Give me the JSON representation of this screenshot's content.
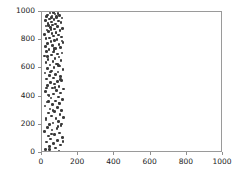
{
  "chart_data": {
    "type": "scatter",
    "title": "",
    "xlabel": "",
    "ylabel": "",
    "xlim": [
      0,
      1000
    ],
    "ylim": [
      0,
      1000
    ],
    "xticks": [
      0,
      200,
      400,
      600,
      800,
      1000
    ],
    "yticks": [
      0,
      200,
      400,
      600,
      800,
      1000
    ],
    "xtick_labels": [
      "0",
      "200",
      "400",
      "600",
      "800",
      "1000"
    ],
    "ytick_labels": [
      "0",
      "200",
      "400",
      "600",
      "800",
      "1000"
    ],
    "grid": false,
    "legend": null,
    "marker_color": "#3a3a3a",
    "marker_size": 2.6,
    "frame_color": "#9a9a9a",
    "background_color": "#ffffff",
    "n_points": 150,
    "series": [
      {
        "name": "points",
        "points": [
          [
            62,
            998
          ],
          [
            44,
            994
          ],
          [
            88,
            991
          ],
          [
            71,
            986
          ],
          [
            30,
            980
          ],
          [
            97,
            976
          ],
          [
            55,
            971
          ],
          [
            25,
            966
          ],
          [
            80,
            962
          ],
          [
            110,
            957
          ],
          [
            40,
            951
          ],
          [
            66,
            946
          ],
          [
            18,
            941
          ],
          [
            92,
            936
          ],
          [
            51,
            930
          ],
          [
            104,
            925
          ],
          [
            33,
            919
          ],
          [
            74,
            914
          ],
          [
            59,
            908
          ],
          [
            21,
            902
          ],
          [
            86,
            897
          ],
          [
            46,
            891
          ],
          [
            113,
            885
          ],
          [
            68,
            879
          ],
          [
            28,
            873
          ],
          [
            99,
            867
          ],
          [
            37,
            861
          ],
          [
            78,
            855
          ],
          [
            56,
            848
          ],
          [
            15,
            842
          ],
          [
            90,
            836
          ],
          [
            64,
            829
          ],
          [
            107,
            823
          ],
          [
            42,
            816
          ],
          [
            23,
            810
          ],
          [
            83,
            803
          ],
          [
            70,
            796
          ],
          [
            49,
            789
          ],
          [
            117,
            782
          ],
          [
            31,
            775
          ],
          [
            95,
            768
          ],
          [
            58,
            761
          ],
          [
            19,
            754
          ],
          [
            102,
            747
          ],
          [
            76,
            740
          ],
          [
            39,
            733
          ],
          [
            66,
            725
          ],
          [
            26,
            718
          ],
          [
            111,
            710
          ],
          [
            85,
            703
          ],
          [
            52,
            695
          ],
          [
            13,
            688
          ],
          [
            93,
            680
          ],
          [
            72,
            672
          ],
          [
            34,
            664
          ],
          [
            106,
            656
          ],
          [
            60,
            648
          ],
          [
            22,
            640
          ],
          [
            80,
            632
          ],
          [
            45,
            624
          ],
          [
            98,
            616
          ],
          [
            67,
            608
          ],
          [
            29,
            600
          ],
          [
            116,
            592
          ],
          [
            54,
            583
          ],
          [
            88,
            575
          ],
          [
            17,
            567
          ],
          [
            75,
            558
          ],
          [
            41,
            550
          ],
          [
            101,
            541
          ],
          [
            62,
            533
          ],
          [
            24,
            524
          ],
          [
            109,
            515
          ],
          [
            84,
            507
          ],
          [
            48,
            498
          ],
          [
            70,
            489
          ],
          [
            32,
            480
          ],
          [
            94,
            471
          ],
          [
            57,
            462
          ],
          [
            120,
            453
          ],
          [
            79,
            444
          ],
          [
            20,
            435
          ],
          [
            103,
            426
          ],
          [
            64,
            417
          ],
          [
            38,
            408
          ],
          [
            90,
            398
          ],
          [
            50,
            389
          ],
          [
            114,
            380
          ],
          [
            73,
            370
          ],
          [
            27,
            361
          ],
          [
            97,
            351
          ],
          [
            59,
            342
          ],
          [
            16,
            332
          ],
          [
            86,
            322
          ],
          [
            44,
            313
          ],
          [
            108,
            303
          ],
          [
            68,
            293
          ],
          [
            35,
            283
          ],
          [
            100,
            273
          ],
          [
            53,
            263
          ],
          [
            118,
            253
          ],
          [
            77,
            243
          ],
          [
            23,
            233
          ],
          [
            91,
            223
          ],
          [
            61,
            213
          ],
          [
            42,
            203
          ],
          [
            105,
            193
          ],
          [
            30,
            182
          ],
          [
            82,
            172
          ],
          [
            56,
            162
          ],
          [
            14,
            151
          ],
          [
            96,
            141
          ],
          [
            70,
            131
          ],
          [
            37,
            120
          ],
          [
            112,
            110
          ],
          [
            48,
            99
          ],
          [
            87,
            89
          ],
          [
            25,
            78
          ],
          [
            65,
            68
          ],
          [
            101,
            57
          ],
          [
            40,
            47
          ],
          [
            75,
            36
          ],
          [
            19,
            26
          ],
          [
            93,
            15
          ],
          [
            58,
            6
          ],
          [
            52,
            960
          ],
          [
            35,
            905
          ],
          [
            78,
            850
          ],
          [
            110,
            795
          ],
          [
            66,
            740
          ],
          [
            29,
            685
          ],
          [
            84,
            630
          ],
          [
            47,
            575
          ],
          [
            102,
            520
          ],
          [
            71,
            465
          ],
          [
            33,
            410
          ],
          [
            95,
            355
          ],
          [
            60,
            300
          ],
          [
            21,
            245
          ],
          [
            88,
            190
          ],
          [
            54,
            135
          ],
          [
            116,
            80
          ],
          [
            43,
            25
          ],
          [
            79,
            970
          ],
          [
            63,
            715
          ],
          [
            26,
            460
          ],
          [
            107,
            205
          ],
          [
            50,
            875
          ],
          [
            92,
            620
          ],
          [
            36,
            365
          ]
        ]
      }
    ]
  }
}
